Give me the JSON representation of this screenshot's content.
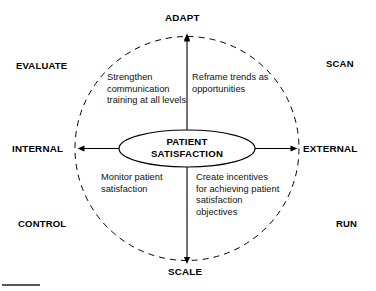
{
  "diagram": {
    "type": "strategy-quadrant-circle",
    "center": {
      "line1": "PATIENT",
      "line2": "SATISFACTION"
    },
    "axes": {
      "top": "ADAPT",
      "bottom": "SCALE",
      "left": "INTERNAL",
      "right": "EXTERNAL"
    },
    "quadrant_words": {
      "top_left": "EVALUATE",
      "top_right": "SCAN",
      "bottom_left": "CONTROL",
      "bottom_right": "RUN"
    },
    "notes": {
      "top_left": "Strengthen communication training at all levels",
      "top_right": "Reframe trends as opportunities",
      "bottom_left": "Monitor patient satisfaction",
      "bottom_right": "Create incentives for achieving patient satisfaction objectives"
    },
    "colors": {
      "stroke": "#000000",
      "background": "#ffffff",
      "text": "#000000",
      "rule": "#555555"
    }
  }
}
